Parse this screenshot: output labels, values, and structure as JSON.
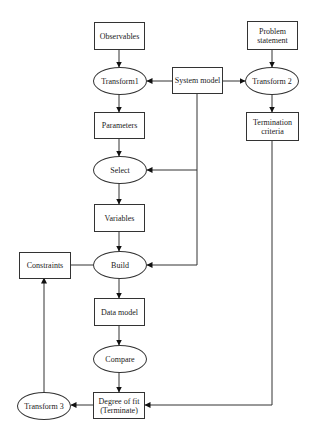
{
  "diagram": {
    "type": "flowchart",
    "nodes": [
      {
        "id": "observables",
        "shape": "box",
        "label": "Observables"
      },
      {
        "id": "transform1",
        "shape": "ellipse",
        "label": "Transform1"
      },
      {
        "id": "parameters",
        "shape": "box",
        "label": "Parameters"
      },
      {
        "id": "select",
        "shape": "ellipse",
        "label": "Select"
      },
      {
        "id": "variables",
        "shape": "box",
        "label": "Variables"
      },
      {
        "id": "build",
        "shape": "ellipse",
        "label": "Build"
      },
      {
        "id": "constraints",
        "shape": "box",
        "label": "Constraints"
      },
      {
        "id": "data_model",
        "shape": "box",
        "label": "Data model"
      },
      {
        "id": "compare",
        "shape": "ellipse",
        "label": "Compare"
      },
      {
        "id": "degree_of_fit",
        "shape": "box",
        "label": "Degree of fit\n(Terminate)"
      },
      {
        "id": "transform3",
        "shape": "ellipse",
        "label": "Transform 3"
      },
      {
        "id": "system_model",
        "shape": "box",
        "label": "System model"
      },
      {
        "id": "problem_statement",
        "shape": "box",
        "label": "Problem\nstatement"
      },
      {
        "id": "transform2",
        "shape": "ellipse",
        "label": "Transform 2"
      },
      {
        "id": "termination_criteria",
        "shape": "box",
        "label": "Termination\ncriteria"
      }
    ],
    "edges": [
      {
        "from": "observables",
        "to": "transform1"
      },
      {
        "from": "transform1",
        "to": "parameters"
      },
      {
        "from": "parameters",
        "to": "select"
      },
      {
        "from": "select",
        "to": "variables"
      },
      {
        "from": "variables",
        "to": "build"
      },
      {
        "from": "build",
        "to": "data_model"
      },
      {
        "from": "data_model",
        "to": "compare"
      },
      {
        "from": "compare",
        "to": "degree_of_fit"
      },
      {
        "from": "degree_of_fit",
        "to": "transform3"
      },
      {
        "from": "transform3",
        "to": "constraints"
      },
      {
        "from": "constraints",
        "to": "build",
        "arrow": false
      },
      {
        "from": "system_model",
        "to": "transform1"
      },
      {
        "from": "system_model",
        "to": "transform2"
      },
      {
        "from": "system_model",
        "to": "select"
      },
      {
        "from": "system_model",
        "to": "build"
      },
      {
        "from": "problem_statement",
        "to": "transform2"
      },
      {
        "from": "transform2",
        "to": "termination_criteria"
      },
      {
        "from": "termination_criteria",
        "to": "degree_of_fit"
      }
    ]
  },
  "labels": {
    "observables": "Observables",
    "transform1": "Transform1",
    "parameters": "Parameters",
    "select": "Select",
    "variables": "Variables",
    "build": "Build",
    "constraints": "Constraints",
    "data_model": "Data model",
    "compare": "Compare",
    "degree_of_fit": "Degree of fit\n(Terminate)",
    "transform3": "Transform 3",
    "system_model": "System model",
    "problem_statement": "Problem\nstatement",
    "transform2": "Transform 2",
    "termination_criteria": "Termination\ncriteria"
  },
  "colors": {
    "line": "#333333",
    "background": "#ffffff",
    "text": "#1a1a1a"
  }
}
